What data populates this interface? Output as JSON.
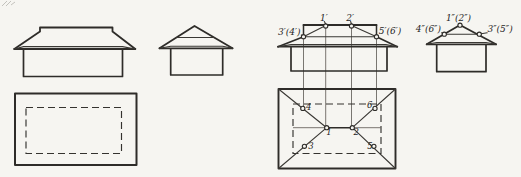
{
  "diagram": {
    "colors": {
      "background": "#f6f5f1",
      "ink": "#2e2c29",
      "construction_ink": "#6b6862"
    },
    "left_group": {
      "front_view": "plain front elevation of hip roof with eaves overhang",
      "side_view": "plain side elevation, triangle gable with level line",
      "plan_view": "plan: solid roof outline with dashed wall rectangle"
    },
    "right_group": {
      "front_view": {
        "labels": {
          "p1": "1′",
          "p2": "2′",
          "p34": "3′(4′)",
          "p56": "5′(6′)"
        }
      },
      "side_view": {
        "labels": {
          "p12": "1″(2″)",
          "p46": "4″(6″)",
          "p35": "3″(5″)"
        }
      },
      "plan_view": {
        "labels": {
          "p1": "1",
          "p2": "2",
          "p3": "3",
          "p4": "4",
          "p5": "5",
          "p6": "6"
        }
      }
    }
  }
}
